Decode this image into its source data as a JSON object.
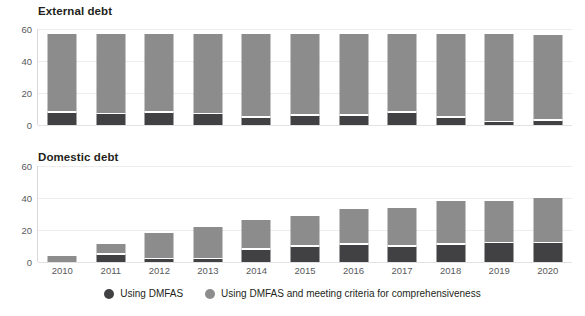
{
  "legend": {
    "items": [
      {
        "label": "Using DMFAS",
        "color": "#414042",
        "marker": "circle-dark-icon"
      },
      {
        "label": "Using DMFAS and meeting criteria for comprehensiveness",
        "color": "#8c8c8c",
        "marker": "circle-light-icon"
      }
    ]
  },
  "colors": {
    "dark": "#414042",
    "light": "#8c8c8c",
    "gridline": "#ededed",
    "axis": "#d9d9d9",
    "text": "#231f20",
    "tick_text": "#58595b",
    "background": "#ffffff"
  },
  "chart_data": [
    {
      "type": "bar",
      "title": "External debt",
      "stacked": true,
      "xlabel": "",
      "ylabel": "",
      "ylim": [
        0,
        60
      ],
      "yticks": [
        0,
        20,
        40,
        60
      ],
      "grid": true,
      "legend_position": "bottom",
      "categories": [
        "2010",
        "2011",
        "2012",
        "2013",
        "2014",
        "2015",
        "2016",
        "2017",
        "2018",
        "2019",
        "2020"
      ],
      "series": [
        {
          "name": "Using DMFAS",
          "color": "#414042",
          "values": [
            8,
            7,
            8,
            7,
            5,
            6,
            6,
            8,
            5,
            2,
            3
          ]
        },
        {
          "name": "Using DMFAS and meeting criteria for comprehensiveness",
          "color": "#8c8c8c",
          "values": [
            49,
            50,
            49,
            50,
            52,
            51,
            51,
            49,
            52,
            55,
            53
          ]
        }
      ],
      "totals": [
        57,
        57,
        57,
        57,
        57,
        57,
        57,
        57,
        57,
        57,
        56
      ]
    },
    {
      "type": "bar",
      "title": "Domestic debt",
      "stacked": true,
      "xlabel": "",
      "ylabel": "",
      "ylim": [
        0,
        60
      ],
      "yticks": [
        0,
        20,
        40,
        60
      ],
      "grid": true,
      "legend_position": "bottom",
      "categories": [
        "2010",
        "2011",
        "2012",
        "2013",
        "2014",
        "2015",
        "2016",
        "2017",
        "2018",
        "2019",
        "2020"
      ],
      "series": [
        {
          "name": "Using DMFAS",
          "color": "#414042",
          "values": [
            0,
            5,
            2,
            2,
            8,
            10,
            11,
            10,
            11,
            12,
            12
          ]
        },
        {
          "name": "Using DMFAS and meeting criteria for comprehensiveness",
          "color": "#8c8c8c",
          "values": [
            4,
            6,
            16,
            20,
            18,
            19,
            22,
            24,
            27,
            26,
            28
          ]
        }
      ],
      "totals": [
        4,
        11,
        18,
        22,
        26,
        29,
        33,
        34,
        38,
        38,
        40
      ]
    }
  ]
}
